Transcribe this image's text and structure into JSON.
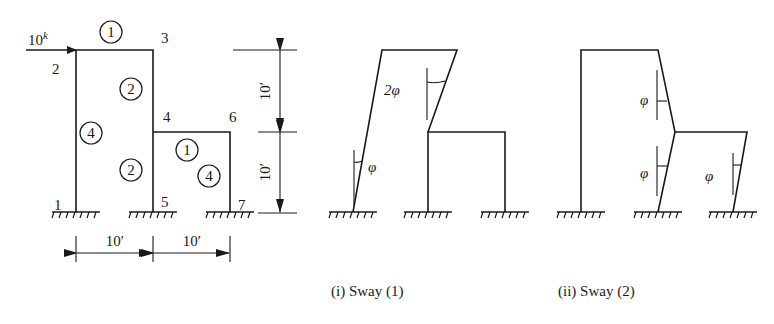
{
  "figure": {
    "frame": {
      "load": {
        "value": "10",
        "unit_superscript": "k"
      },
      "nodes": [
        "1",
        "2",
        "3",
        "4",
        "5",
        "6",
        "7"
      ],
      "member_labels": {
        "beam_2_3": "1",
        "col_3_4": "2",
        "col_1_2": "4",
        "col_4_5": "2",
        "beam_4_6": "1",
        "col_6_7": "4"
      },
      "dimensions": {
        "horizontal": [
          "10′",
          "10′"
        ],
        "vertical": [
          "10′",
          "10′"
        ]
      }
    },
    "sway1": {
      "caption": "(i)  Sway (1)",
      "angle_labels": [
        "2φ",
        "φ"
      ]
    },
    "sway2": {
      "caption": "(ii)  Sway (2)",
      "angle_labels": [
        "φ",
        "φ",
        "φ"
      ]
    }
  }
}
